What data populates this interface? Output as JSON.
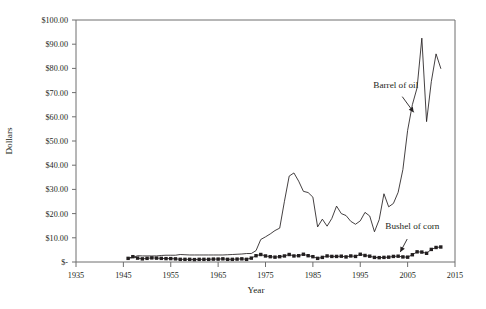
{
  "chart_data": {
    "type": "line",
    "title": "",
    "xlabel": "Year",
    "ylabel": "Dollars",
    "xlim": [
      1935,
      2015
    ],
    "ylim": [
      0,
      100
    ],
    "grid": false,
    "legend_position": "none",
    "xticks": [
      1935,
      1945,
      1955,
      1965,
      1975,
      1985,
      1995,
      2005,
      2015
    ],
    "xtick_labels": [
      "1935",
      "1945",
      "1955",
      "1965",
      "1975",
      "1985",
      "1995",
      "2005",
      "2015"
    ],
    "yticks": [
      0,
      10,
      20,
      30,
      40,
      50,
      60,
      70,
      80,
      90,
      100
    ],
    "ytick_labels": [
      "$-",
      "$10.00",
      "$20.00",
      "$30.00",
      "$40.00",
      "$50.00",
      "$60.00",
      "$70.00",
      "$80.00",
      "$90.00",
      "$100.00"
    ],
    "annotations": [
      {
        "text": "Barrel of oil",
        "label_x": 2002.5,
        "label_y": 72.0,
        "point_x": 2006.6,
        "point_y": 61.0
      },
      {
        "text": "Bushel of corn",
        "label_x": 2006.0,
        "label_y": 13.5,
        "point_x": 2003.2,
        "point_y": 3.2
      }
    ],
    "series": [
      {
        "name": "Barrel of oil",
        "marker": "none",
        "x": [
          1946,
          1947,
          1948,
          1949,
          1950,
          1951,
          1952,
          1953,
          1954,
          1955,
          1956,
          1957,
          1958,
          1959,
          1960,
          1961,
          1962,
          1963,
          1964,
          1965,
          1966,
          1967,
          1968,
          1969,
          1970,
          1971,
          1972,
          1973,
          1974,
          1975,
          1976,
          1977,
          1978,
          1979,
          1980,
          1981,
          1982,
          1983,
          1984,
          1985,
          1986,
          1987,
          1988,
          1989,
          1990,
          1991,
          1992,
          1993,
          1994,
          1995,
          1996,
          1997,
          1998,
          1999,
          2000,
          2001,
          2002,
          2003,
          2004,
          2005,
          2006,
          2007,
          2008,
          2009,
          2010,
          2011,
          2012
        ],
        "values": [
          1.4,
          1.9,
          2.6,
          2.5,
          2.5,
          2.5,
          2.5,
          2.7,
          2.8,
          2.8,
          2.8,
          3.1,
          3.0,
          2.9,
          2.9,
          2.9,
          2.9,
          2.9,
          2.9,
          2.9,
          2.9,
          3.0,
          3.1,
          3.2,
          3.3,
          3.5,
          3.5,
          4.7,
          9.3,
          10.4,
          11.6,
          13.0,
          14.0,
          25.1,
          35.5,
          36.8,
          33.4,
          29.2,
          28.7,
          26.8,
          14.5,
          17.7,
          14.8,
          18.0,
          23.1,
          20.0,
          19.2,
          16.8,
          15.6,
          17.0,
          20.5,
          19.0,
          12.5,
          17.5,
          28.2,
          22.8,
          24.2,
          28.8,
          38.2,
          54.4,
          65.0,
          72.0,
          92.5,
          58.0,
          74.5,
          86.0,
          80.0
        ]
      },
      {
        "name": "Bushel of corn",
        "marker": "square",
        "x": [
          1946,
          1947,
          1948,
          1949,
          1950,
          1951,
          1952,
          1953,
          1954,
          1955,
          1956,
          1957,
          1958,
          1959,
          1960,
          1961,
          1962,
          1963,
          1964,
          1965,
          1966,
          1967,
          1968,
          1969,
          1970,
          1971,
          1972,
          1973,
          1974,
          1975,
          1976,
          1977,
          1978,
          1979,
          1980,
          1981,
          1982,
          1983,
          1984,
          1985,
          1986,
          1987,
          1988,
          1989,
          1990,
          1991,
          1992,
          1993,
          1994,
          1995,
          1996,
          1997,
          1998,
          1999,
          2000,
          2001,
          2002,
          2003,
          2004,
          2005,
          2006,
          2007,
          2008,
          2009,
          2010,
          2011,
          2012
        ],
        "values": [
          1.5,
          2.2,
          1.6,
          1.3,
          1.5,
          1.7,
          1.6,
          1.5,
          1.4,
          1.4,
          1.3,
          1.1,
          1.1,
          1.1,
          1.0,
          1.1,
          1.1,
          1.1,
          1.2,
          1.2,
          1.3,
          1.1,
          1.1,
          1.2,
          1.3,
          1.1,
          1.6,
          2.6,
          3.1,
          2.5,
          2.2,
          2.0,
          2.2,
          2.5,
          3.1,
          2.5,
          2.6,
          3.2,
          2.6,
          2.2,
          1.5,
          1.9,
          2.5,
          2.3,
          2.3,
          2.4,
          2.1,
          2.5,
          2.3,
          3.2,
          2.7,
          2.4,
          1.9,
          1.8,
          1.9,
          2.0,
          2.3,
          2.4,
          2.1,
          2.0,
          3.0,
          4.2,
          4.1,
          3.6,
          5.2,
          6.0,
          6.2
        ]
      }
    ]
  },
  "axes": {
    "y_title": "Dollars",
    "x_title": "Year"
  }
}
